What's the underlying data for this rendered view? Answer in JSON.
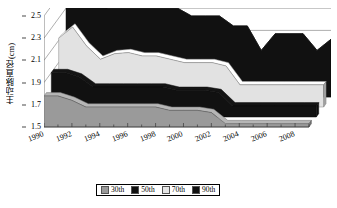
{
  "chart_data": {
    "type": "area",
    "title": "",
    "subtitle": "",
    "xlabel": "",
    "ylabel": "主动脉直径(cm)",
    "ylim": [
      1.5,
      2.5
    ],
    "xlim": [
      1990,
      2009
    ],
    "grid": true,
    "three_d": true,
    "stacked": false,
    "legend_position": "bottom",
    "y_ticks": [
      "1.5",
      "1.7",
      "1.9",
      "2.1",
      "2.3",
      "2.5"
    ],
    "y_tick_values": [
      1.5,
      1.7,
      1.9,
      2.1,
      2.3,
      2.5
    ],
    "x_tick_labels": [
      "1990",
      "1992",
      "1994",
      "1996",
      "1998",
      "2000",
      "2002",
      "2004",
      "2006",
      "2008"
    ],
    "x_tick_values": [
      1990,
      1992,
      1994,
      1996,
      1998,
      2000,
      2002,
      2004,
      2006,
      2008
    ],
    "x": [
      1990,
      1991,
      1992,
      1993,
      1994,
      1995,
      1996,
      1997,
      1998,
      1999,
      2000,
      2001,
      2002,
      2003,
      2004,
      2005,
      2006,
      2007,
      2008,
      2009
    ],
    "series": [
      {
        "name": "90th",
        "color": "#111111",
        "values": [
          2.45,
          2.54,
          2.33,
          2.3,
          2.3,
          2.3,
          2.3,
          2.3,
          2.3,
          2.23,
          2.23,
          2.23,
          2.14,
          2.14,
          1.92,
          2.07,
          2.07,
          2.07,
          1.92,
          2.02
        ]
      },
      {
        "name": "70th",
        "color": "#e2e2e2",
        "values": [
          2.12,
          2.22,
          2.05,
          1.93,
          1.98,
          1.99,
          1.96,
          1.96,
          1.93,
          1.9,
          1.9,
          1.9,
          1.87,
          1.7,
          1.7,
          1.7,
          1.7,
          1.7,
          1.7,
          1.7
        ]
      },
      {
        "name": "50th",
        "color": "#111111",
        "values": [
          1.9,
          1.9,
          1.86,
          1.77,
          1.77,
          1.77,
          1.77,
          1.77,
          1.77,
          1.74,
          1.74,
          1.74,
          1.72,
          1.6,
          1.6,
          1.6,
          1.6,
          1.6,
          1.6,
          1.6
        ]
      },
      {
        "name": "30th",
        "color": "#9a9a9a",
        "values": [
          1.78,
          1.78,
          1.74,
          1.68,
          1.68,
          1.68,
          1.68,
          1.68,
          1.68,
          1.65,
          1.65,
          1.65,
          1.63,
          1.53,
          1.53,
          1.53,
          1.53,
          1.53,
          1.53,
          1.53
        ]
      }
    ]
  },
  "legend": {
    "items": [
      {
        "label": "30th",
        "color": "#9a9a9a"
      },
      {
        "label": "50th",
        "color": "#111111"
      },
      {
        "label": "70th",
        "color": "#e6e6e6"
      },
      {
        "label": "90th",
        "color": "#111111"
      }
    ]
  },
  "axes": {
    "y_title": "主动脉直径(cm)"
  }
}
